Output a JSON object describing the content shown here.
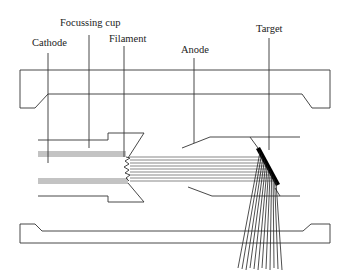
{
  "labels": {
    "cathode": "Cathode",
    "focussing_cup": "Focussing cup",
    "filament": "Filament",
    "anode": "Anode",
    "target": "Target"
  },
  "colors": {
    "line": "#333333",
    "beam": "#555555",
    "target": "#000000",
    "background": "#ffffff"
  },
  "components": [
    "cathode",
    "focussing_cup",
    "filament",
    "electron_beam",
    "anode",
    "target",
    "x_ray_fan",
    "housing"
  ],
  "electron_beam_count": 9,
  "xray_count": 12
}
